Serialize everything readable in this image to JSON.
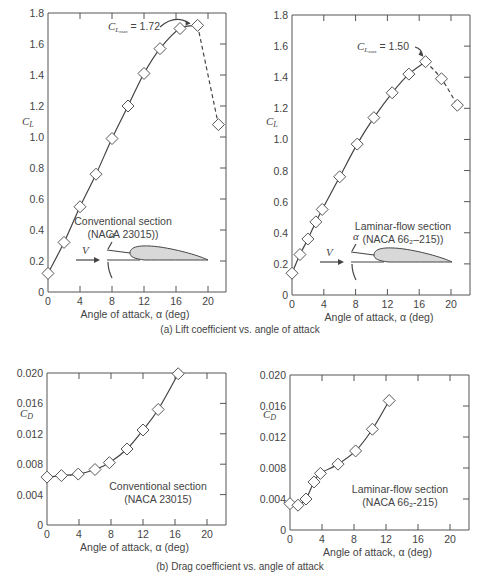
{
  "figure": {
    "caption_a": "(a) Lift coefficient vs. angle of attack",
    "caption_b": "(b) Drag coefficient vs. angle of attack"
  },
  "chart_data": [
    {
      "id": "lift_conventional",
      "type": "line",
      "title": "Conventional section (NACA 23015))",
      "section_label_1": "Conventional section",
      "section_label_2": "(NACA 23015))",
      "xlabel": "Angle of attack, α (deg)",
      "ylabel": "C_L",
      "xlim": [
        0,
        22
      ],
      "ylim": [
        0,
        1.8
      ],
      "xticks": [
        0,
        4,
        8,
        12,
        16,
        20
      ],
      "yticks": [
        0,
        0.2,
        0.4,
        0.6,
        0.8,
        1.0,
        1.2,
        1.4,
        1.6,
        1.8
      ],
      "annotation": "C_Lmax = 1.72",
      "x": [
        0,
        2,
        4,
        6,
        8,
        10,
        12,
        14,
        16.5,
        18.7,
        21.3
      ],
      "values": [
        0.12,
        0.32,
        0.55,
        0.76,
        0.99,
        1.2,
        1.41,
        1.57,
        1.7,
        1.72,
        1.08
      ],
      "dashed_after_x": 18.7
    },
    {
      "id": "lift_laminar",
      "type": "line",
      "title": "Laminar-flow section (NACA 66₂-215))",
      "section_label_1": "Laminar-flow section",
      "section_label_2": "(NACA 66₂–215))",
      "xlabel": "Angle of attack, α (deg)",
      "ylabel": "C_L",
      "xlim": [
        0,
        22
      ],
      "ylim": [
        0,
        1.8
      ],
      "xticks": [
        0,
        4,
        8,
        12,
        16,
        20
      ],
      "yticks": [
        0,
        0.2,
        0.4,
        0.6,
        0.8,
        1.0,
        1.2,
        1.4,
        1.6,
        1.8
      ],
      "annotation": "C_Lmax = 1.50",
      "x": [
        0,
        1,
        2,
        3,
        3.8,
        6,
        8.2,
        10.3,
        12.6,
        14.7,
        16.8,
        18.8,
        20.8
      ],
      "values": [
        0.14,
        0.26,
        0.36,
        0.47,
        0.55,
        0.76,
        0.97,
        1.14,
        1.3,
        1.42,
        1.5,
        1.39,
        1.22
      ],
      "dashed_after_x": 16.8
    },
    {
      "id": "drag_conventional",
      "type": "line",
      "title": "Conventional section (NACA 23015)",
      "section_label_1": "Conventional section",
      "section_label_2": "(NACA 23015)",
      "xlabel": "Angle of attack, α (deg)",
      "ylabel": "C_D",
      "xlim": [
        0,
        22
      ],
      "ylim": [
        0,
        0.02
      ],
      "xticks": [
        0,
        4,
        8,
        12,
        16,
        20
      ],
      "yticks": [
        0,
        0.004,
        0.008,
        0.012,
        0.016,
        0.02
      ],
      "x": [
        0,
        1.8,
        3.9,
        6,
        7.8,
        10,
        12,
        13.9,
        16.4
      ],
      "values": [
        0.0063,
        0.0065,
        0.0067,
        0.0073,
        0.0082,
        0.01,
        0.0125,
        0.0152,
        0.0199
      ]
    },
    {
      "id": "drag_laminar",
      "type": "line",
      "title": "Laminar-flow section (NACA 66₂-215)",
      "section_label_1": "Laminar-flow section",
      "section_label_2": "(NACA 66₂-215)",
      "xlabel": "Angle of attack, α (deg)",
      "ylabel": "C_D",
      "xlim": [
        0,
        22
      ],
      "ylim": [
        0,
        0.02
      ],
      "xticks": [
        0,
        4,
        8,
        12,
        16,
        20
      ],
      "yticks": [
        0,
        0.004,
        0.008,
        0.012,
        0.016,
        0.02
      ],
      "x": [
        0,
        1,
        2,
        3,
        3.8,
        6,
        8.2,
        10.3,
        12.4
      ],
      "values": [
        0.0034,
        0.0032,
        0.004,
        0.0062,
        0.0073,
        0.0085,
        0.0102,
        0.013,
        0.0167
      ]
    }
  ],
  "diagram": {
    "velocity_label": "V",
    "alpha_label": "α"
  }
}
